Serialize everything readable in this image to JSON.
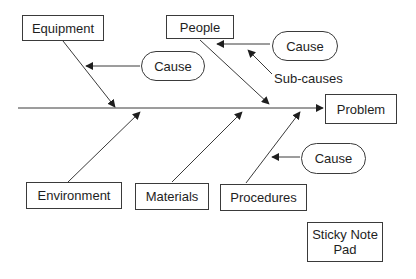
{
  "diagram": {
    "type": "fishbone",
    "effect": "Problem",
    "categories": {
      "top": [
        "Equipment",
        "People"
      ],
      "bottom": [
        "Environment",
        "Materials",
        "Procedures"
      ]
    },
    "causes": [
      {
        "label": "Cause",
        "attached_to": "Equipment"
      },
      {
        "label": "Cause",
        "attached_to": "People"
      },
      {
        "label": "Cause",
        "attached_to": "Procedures"
      }
    ],
    "annotation": "Sub-causes",
    "note": "Sticky Note Pad"
  },
  "colors": {
    "line": "#3a3a3a",
    "background": "#ffffff"
  }
}
